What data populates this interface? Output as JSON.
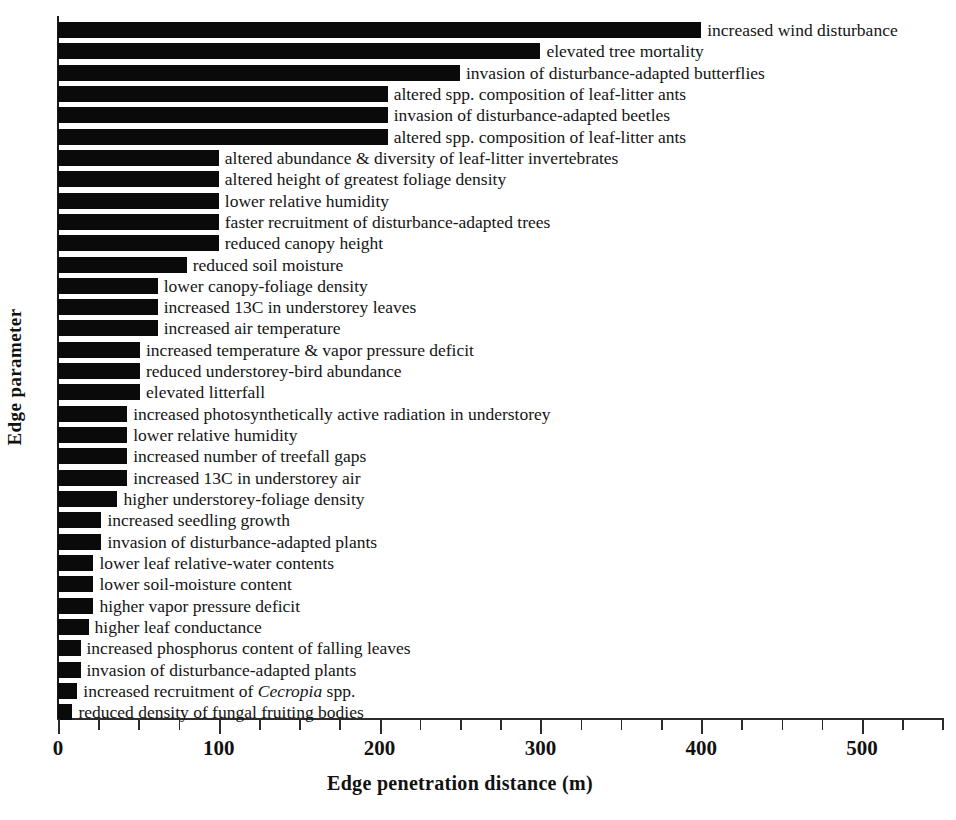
{
  "chart_data": {
    "type": "bar",
    "orientation": "horizontal",
    "title": "",
    "xlabel": "Edge penetration distance (m)",
    "ylabel": "Edge parameter",
    "xlim": [
      0,
      550
    ],
    "xticks_major": [
      0,
      100,
      200,
      300,
      400,
      500
    ],
    "xtick_labels": [
      "0",
      "100",
      "200",
      "300",
      "400",
      "500"
    ],
    "xticks_minor_step": 25,
    "grid": false,
    "legend": null,
    "bar_color": "#0a0a0a",
    "categories": [
      "increased wind disturbance",
      "elevated tree mortality",
      "invasion of disturbance-adapted butterflies",
      "altered spp. composition of leaf-litter ants",
      "invasion of disturbance-adapted beetles",
      "altered spp. composition of leaf-litter ants",
      "altered abundance & diversity of leaf-litter invertebrates",
      "altered height of greatest foliage density",
      "lower relative humidity",
      "faster recruitment of disturbance-adapted trees",
      "reduced canopy height",
      "reduced soil moisture",
      "lower canopy-foliage density",
      "increased 13C in understorey leaves",
      "increased air temperature",
      "increased temperature & vapor pressure deficit",
      "reduced understorey-bird abundance",
      "elevated litterfall",
      "increased photosynthetically active radiation in understorey",
      "lower relative humidity",
      "increased number of treefall gaps",
      "increased 13C in understorey air",
      "higher understorey-foliage density",
      "increased seedling growth",
      "invasion of disturbance-adapted plants",
      "lower leaf relative-water contents",
      "lower soil-moisture content",
      "higher vapor pressure deficit",
      "higher leaf conductance",
      "increased phosphorus content of falling leaves",
      "invasion of disturbance-adapted plants",
      "increased recruitment of Cecropia spp.",
      "reduced density of fungal fruiting bodies"
    ],
    "categories_html": [
      "increased wind disturbance",
      "elevated tree mortality",
      "invasion of disturbance-adapted butterflies",
      "altered spp. composition of leaf-litter ants",
      "invasion of disturbance-adapted beetles",
      "altered spp. composition of leaf-litter ants",
      "altered abundance &amp; diversity of leaf-litter invertebrates",
      "altered height of greatest foliage density",
      "lower relative humidity",
      "faster recruitment of disturbance-adapted trees",
      "reduced canopy height",
      "reduced soil moisture",
      "lower canopy-foliage density",
      "increased 13C in understorey leaves",
      "increased air temperature",
      "increased temperature &amp; vapor pressure deficit",
      "reduced understorey-bird abundance",
      "elevated litterfall",
      "increased photosynthetically active radiation in understorey",
      "lower relative humidity",
      "increased number of treefall gaps",
      "increased 13C in understorey air",
      "higher understorey-foliage density",
      "increased seedling growth",
      "invasion of disturbance-adapted plants",
      "lower leaf relative-water contents",
      "lower soil-moisture content",
      "higher vapor pressure deficit",
      "higher leaf conductance",
      "increased phosphorus content of falling leaves",
      "invasion of disturbance-adapted plants",
      "increased recruitment of <em>Cecropia</em> spp.",
      "reduced density of fungal fruiting bodies"
    ],
    "values": [
      400,
      300,
      250,
      205,
      205,
      205,
      100,
      100,
      100,
      100,
      100,
      80,
      62,
      62,
      62,
      51,
      51,
      51,
      43,
      43,
      43,
      43,
      37,
      27,
      27,
      22,
      22,
      22,
      19,
      14,
      14,
      12,
      9
    ]
  }
}
